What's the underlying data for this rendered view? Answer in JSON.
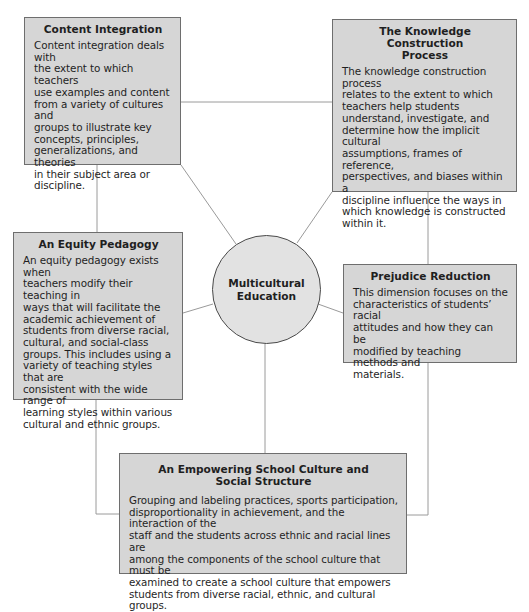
{
  "diagram": {
    "center": {
      "label": "Multicultural\nEducation"
    },
    "dimensions": [
      {
        "id": "content-integration",
        "title": "Content Integration",
        "body": "Content integration deals with\nthe extent to which teachers\nuse examples and content\nfrom a variety of cultures and\ngroups to illustrate key\nconcepts, principles,\ngeneralizations, and theories\nin their subject area or\ndiscipline."
      },
      {
        "id": "knowledge-construction",
        "title": "The Knowledge Construction\nProcess",
        "body": "The knowledge construction process\nrelates to the extent to which\nteachers help students\nunderstand, investigate, and\ndetermine how the implicit cultural\nassumptions, frames of reference,\nperspectives, and biases within a\ndiscipline influence the ways in\nwhich knowledge is constructed\nwithin it."
      },
      {
        "id": "equity-pedagogy",
        "title": "An Equity Pedagogy",
        "body": "An equity pedagogy exists when\nteachers modify their teaching in\nways that will facilitate the\nacademic achievement of\nstudents from diverse racial,\ncultural, and social-class\ngroups. This includes using a\nvariety of teaching styles that are\nconsistent with the wide range of\nlearning styles within various\ncultural and ethnic groups."
      },
      {
        "id": "prejudice-reduction",
        "title": "Prejudice Reduction",
        "body": "This dimension focuses on the\ncharacteristics of students’ racial\nattitudes and how they can be\nmodified by teaching methods and\nmaterials."
      },
      {
        "id": "empowering-school-culture",
        "title": "An Empowering School Culture and\nSocial Structure",
        "body": "Grouping and labeling practices, sports participation,\ndisproportionality in achievement, and the interaction of the\nstaff and the students across ethnic and racial lines are\namong the components of the school culture that must be\nexamined to create a school culture that empowers\nstudents from diverse racial, ethnic, and cultural groups."
      }
    ],
    "colors": {
      "box_fill": "#d6d6d6",
      "box_border": "#6e6e6e",
      "circle_fill": "#e2e2e2",
      "connector": "#9a9a9a",
      "text": "#1f1f1f"
    }
  }
}
